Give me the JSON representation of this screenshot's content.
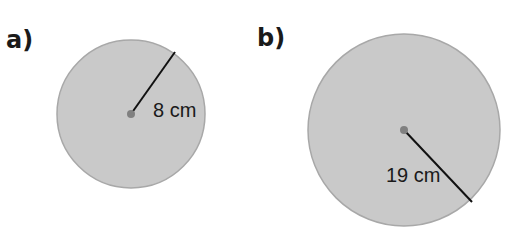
{
  "figures": [
    {
      "label": "a)",
      "radius_text": "8 cm",
      "circle": {
        "cx": 131,
        "cy": 114,
        "r": 74
      },
      "radius_line": {
        "x1": 131,
        "y1": 114,
        "x2": 175,
        "y2": 52
      },
      "text_pos": {
        "x": 153,
        "y": 117
      }
    },
    {
      "label": "b)",
      "radius_text": "19 cm",
      "circle": {
        "cx": 404,
        "cy": 130,
        "r": 96
      },
      "radius_line": {
        "x1": 404,
        "y1": 130,
        "x2": 472,
        "y2": 202
      },
      "text_pos": {
        "x": 386,
        "y": 182
      }
    }
  ],
  "colors": {
    "fill": "#c9c9c9",
    "stroke": "#a8a8a8",
    "line": "#111111",
    "center": "#808080"
  }
}
